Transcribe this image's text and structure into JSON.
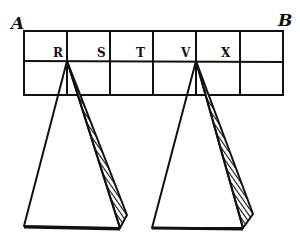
{
  "figure": {
    "style": "woodcut line diagram",
    "ink_color": "#111111",
    "paper_color": "#ffffff",
    "corner_labels": {
      "left": "A",
      "right": "B"
    },
    "grid": {
      "rows": 2,
      "columns": 6,
      "cell_labels": [
        "R",
        "S",
        "T",
        "V",
        "X",
        ""
      ]
    },
    "pyramids": [
      {
        "apex_label": "R",
        "shaded_side": "right"
      },
      {
        "apex_label": "V",
        "shaded_side": "right"
      }
    ]
  }
}
